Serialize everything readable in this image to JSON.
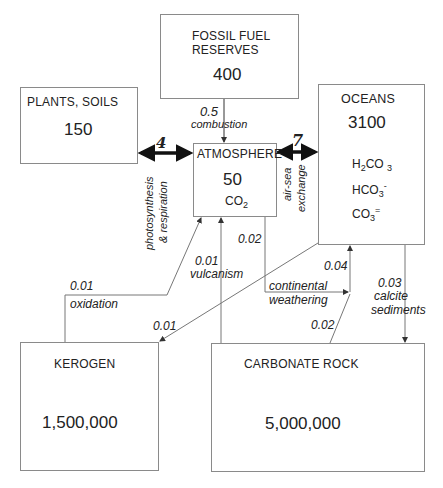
{
  "reservoirs": {
    "fossil_fuel": {
      "label_line1": "FOSSIL FUEL",
      "label_line2": "RESERVES",
      "value": "400"
    },
    "plants_soils": {
      "label": "PLANTS, SOILS",
      "value": "150"
    },
    "atmosphere": {
      "label": "ATMOSPHERE",
      "value": "50",
      "species": "CO",
      "species_sub": "2"
    },
    "oceans": {
      "label": "OCEANS",
      "value": "3100",
      "species": [
        {
          "pre": "H",
          "pre_sub": "2",
          "base": "CO",
          "sub": "3",
          "sup": ""
        },
        {
          "pre": "",
          "pre_sub": "",
          "base": "HCO",
          "sub": "3",
          "sup": "-"
        },
        {
          "pre": "",
          "pre_sub": "",
          "base": "CO",
          "sub": "3",
          "sup": "="
        }
      ]
    },
    "kerogen": {
      "label": "KEROGEN",
      "value": "1,500,000"
    },
    "carbonate_rock": {
      "label": "CARBONATE ROCK",
      "value": "5,000,000"
    }
  },
  "fluxes": {
    "combustion": {
      "value": "0.5",
      "label": "combustion"
    },
    "photosynthesis": {
      "value": "4",
      "label_line1": "photosynthesis",
      "label_line2": "& respiration"
    },
    "air_sea": {
      "value": "7",
      "label_line1": "air-sea",
      "label_line2": "exchange"
    },
    "oxidation": {
      "value": "0.01",
      "label": "oxidation"
    },
    "vulcanism": {
      "value": "0.01",
      "label": "vulcanism"
    },
    "weathering_atm": {
      "value": "0.02"
    },
    "continental_weathering": {
      "label_line1": "continental",
      "label_line2": "weathering"
    },
    "weathering_to_ocean": {
      "value": "0.04"
    },
    "carbonate_weathering": {
      "value": "0.02"
    },
    "ocean_to_kerogen": {
      "value": "0.01"
    },
    "calcite": {
      "value": "0.03",
      "label_line1": "calcite",
      "label_line2": "sediments"
    }
  },
  "colors": {
    "line": "#6e6e6e",
    "border": "#8a8a8a",
    "text": "#222222",
    "arrow": "#111111"
  }
}
